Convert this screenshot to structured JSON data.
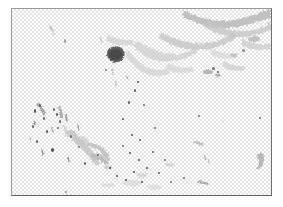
{
  "app": {
    "title": "Transparent Background Grunge Texture",
    "view_mode": "canvas",
    "zoom_level": "100%"
  },
  "canvas": {
    "name": "artwork-canvas",
    "width_px": 261,
    "height_px": 188,
    "offset_x_px": 11,
    "offset_y_px": 8,
    "background_label": "Transparent",
    "checker": {
      "cell_size_px": 2,
      "light_color": "#ffffff",
      "dark_color": "#e3e3e3"
    },
    "border": {
      "top_color": "#9a9a9a",
      "left_color": "#9a9a9a",
      "right_color": "#6e6e6e",
      "bottom_color": "#5f5f5f",
      "width_px": 1
    }
  },
  "page_background_color": "#ffffff",
  "artwork": {
    "name": "grunge-splatter-texture",
    "type": "raster-texture",
    "palette": {
      "darkest": "#3a3a3a",
      "dark": "#5c5c5c",
      "mid": "#8c8c8c",
      "light": "#b4b4b4",
      "faint": "#d2d2d2"
    },
    "regions": [
      {
        "label": "top-right brush sweep",
        "x": 175,
        "y": 5,
        "w": 85,
        "h": 40,
        "tone": "light"
      },
      {
        "label": "upper-center smear",
        "x": 95,
        "y": 20,
        "w": 60,
        "h": 35,
        "tone": "faint"
      },
      {
        "label": "dark blob",
        "x": 108,
        "y": 47,
        "w": 16,
        "h": 14,
        "tone": "dark"
      },
      {
        "label": "left speckle cluster",
        "x": 5,
        "y": 90,
        "w": 50,
        "h": 50,
        "tone": "dark"
      },
      {
        "label": "center splatter burst",
        "x": 75,
        "y": 115,
        "w": 70,
        "h": 60,
        "tone": "mid"
      },
      {
        "label": "right crescent",
        "x": 238,
        "y": 140,
        "w": 16,
        "h": 26,
        "tone": "light"
      },
      {
        "label": "bottom dot field",
        "x": 90,
        "y": 150,
        "w": 110,
        "h": 40,
        "tone": "darkest"
      }
    ],
    "speck_count": 64
  }
}
